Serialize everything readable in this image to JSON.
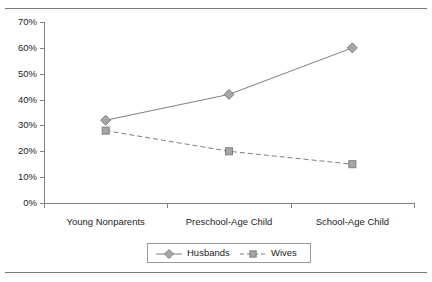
{
  "figure": {
    "has_top_rule": true,
    "has_bottom_rule": true,
    "background_color": "#ffffff",
    "rule_color": "#7a7a7a"
  },
  "chart_data": {
    "type": "line",
    "title": "",
    "subtitle": "",
    "xlabel": "",
    "ylabel": "",
    "categories": [
      "Young Nonparents",
      "Preschool-Age Child",
      "School-Age Child"
    ],
    "series": [
      {
        "name": "Husbands",
        "values": [
          32,
          42,
          60
        ],
        "line_style": "solid",
        "marker": "diamond",
        "color": "#7f7f7f",
        "marker_fill": "#a6a6a6"
      },
      {
        "name": "Wives",
        "values": [
          28,
          20,
          15
        ],
        "line_style": "dashed",
        "marker": "square",
        "color": "#7f7f7f",
        "marker_fill": "#a6a6a6"
      }
    ],
    "ylim": [
      0,
      70
    ],
    "ytick_values": [
      0,
      10,
      20,
      30,
      40,
      50,
      60,
      70
    ],
    "ytick_labels": [
      "0%",
      "10%",
      "20%",
      "30%",
      "40%",
      "50%",
      "60%",
      "70%"
    ],
    "grid": false,
    "legend_position": "bottom-center",
    "axis_color": "#808080"
  },
  "legend": {
    "entries": [
      {
        "label": "Husbands"
      },
      {
        "label": "Wives"
      }
    ]
  }
}
